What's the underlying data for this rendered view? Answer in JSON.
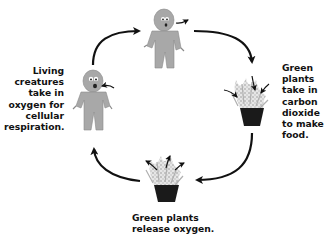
{
  "diagram": {
    "type": "cycle",
    "stages": [
      {
        "id": "person-exhaling",
        "position": "top"
      },
      {
        "id": "plant-absorbing",
        "position": "right"
      },
      {
        "id": "plant-releasing",
        "position": "bottom"
      },
      {
        "id": "person-inhaling",
        "position": "left"
      }
    ],
    "flow": "clockwise",
    "labels": {
      "left": [
        "Living",
        "creatures",
        "take in",
        "oxygen for",
        "cellular",
        "respiration."
      ],
      "right": [
        "Green",
        "plants",
        "take in",
        "carbon",
        "dioxide",
        "to make",
        "food."
      ],
      "bottom": [
        "Green plants",
        "release oxygen."
      ]
    },
    "colors": {
      "figure": "#a8a8a8",
      "figure_outline": "#7a7a7a",
      "pot": "#1a1a1a",
      "arrow": "#111111",
      "text": "#111111"
    }
  }
}
